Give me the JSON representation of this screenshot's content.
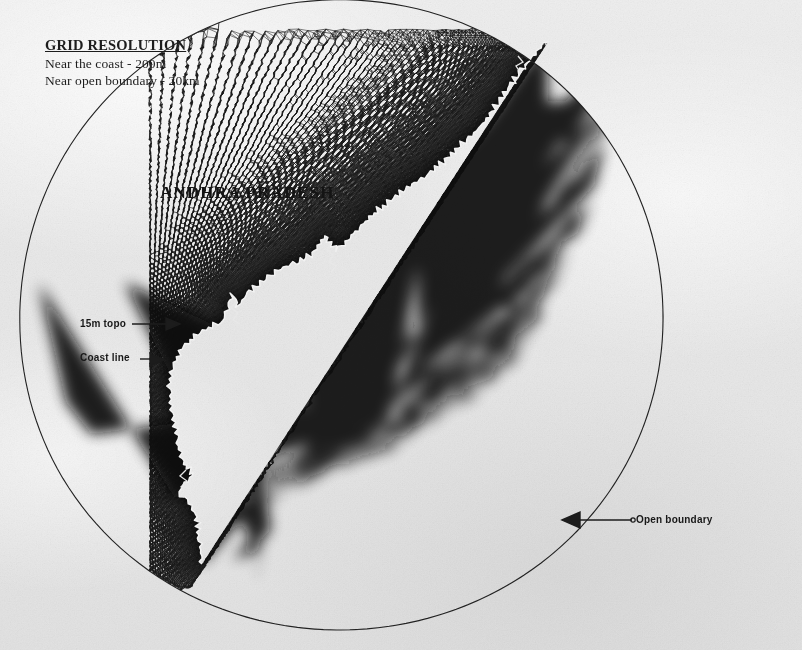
{
  "figure": {
    "kind": "finite-element-mesh-map",
    "state_label": "ANDHRA PRADESH",
    "legend": {
      "title": "GRID RESOLUTION",
      "line1": "Near the coast - 200m",
      "line2": "Near open boundary - 20km"
    },
    "callouts": {
      "topo": "15m topo",
      "coast": "Coast line",
      "open_boundary": "Open boundary"
    },
    "colors": {
      "paper": "#ebebeb",
      "ink": "#141414",
      "mesh": "#1a1a1a",
      "coastline": "#f2f2f2"
    }
  },
  "chart_data": {
    "type": "mesh",
    "title": "ANDHRA PRADESH",
    "resolution": {
      "near_coast": "200m",
      "near_open_boundary": "20km"
    },
    "annotations": [
      {
        "label": "15m topo",
        "x": 80,
        "y": 324,
        "arrow_to_x": 178,
        "arrow_to_y": 324
      },
      {
        "label": "Coast line",
        "x": 80,
        "y": 358,
        "arrow_to_x": 162,
        "arrow_to_y": 360
      },
      {
        "label": "Open boundary",
        "x": 636,
        "y": 520,
        "arrow_to_x": 563,
        "arrow_to_y": 520
      }
    ],
    "boundaries": [
      {
        "name": "coastline",
        "type": "land-boundary",
        "style": "jagged-light-line"
      },
      {
        "name": "open-boundary",
        "type": "sea-boundary",
        "style": "smooth-arc"
      }
    ],
    "domain_extent_px": {
      "x_min": 160,
      "x_max": 668,
      "y_min": 40,
      "y_max": 596
    }
  }
}
